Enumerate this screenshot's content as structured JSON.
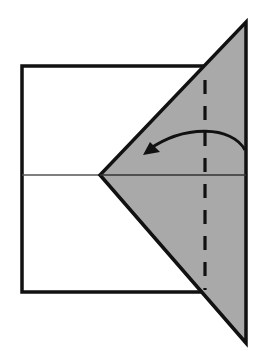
{
  "diagram": {
    "type": "origami-fold-step",
    "canvas": {
      "width": 266,
      "height": 354,
      "background": "#ffffff"
    },
    "colors": {
      "paper_front": "#ffffff",
      "paper_back": "#a9a9a9",
      "outline": "#111111",
      "crease": "#555555",
      "fold_line": "#111111",
      "arrow": "#111111"
    },
    "elements": {
      "rectangle": {
        "x": 22,
        "y": 66,
        "width": 184,
        "height": 226,
        "label": "unfolded paper rectangle"
      },
      "center_crease": {
        "x1": 22,
        "y1": 175,
        "x2": 246,
        "y2": 175,
        "label": "horizontal crease"
      },
      "flap_triangle": {
        "points": "246,22 246,343 100,175",
        "label": "folded flap (colored side)"
      },
      "valley_fold_line": {
        "x": 205,
        "y1": 80,
        "y2": 290,
        "dash": "14,12",
        "label": "valley fold line"
      },
      "fold_arrow": {
        "path": "M 245 150 C 232 126, 185 124, 148 150",
        "label": "fold left arrow"
      }
    }
  }
}
